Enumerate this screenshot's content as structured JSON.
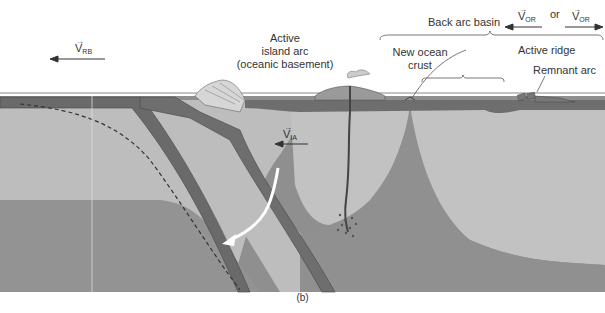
{
  "figure": {
    "caption": "(b)",
    "labels": {
      "active_island_arc_line1": "Active",
      "active_island_arc_line2": "island arc",
      "active_island_arc_line3": "(oceanic basement)",
      "back_arc_basin": "Back arc basin",
      "new_ocean_crust_line1": "New ocean",
      "new_ocean_crust_line2": "crust",
      "active_ridge": "Active ridge",
      "remnant_arc": "Remnant arc",
      "or": "or"
    },
    "vectors": {
      "v_rb": {
        "symbol": "V",
        "subscript": "RB",
        "direction": "left"
      },
      "v_ia": {
        "symbol": "V",
        "subscript": "IA",
        "direction": "left"
      },
      "v_or_left": {
        "symbol": "V",
        "subscript": "OR",
        "direction": "left"
      },
      "v_or_right": {
        "symbol": "V",
        "subscript": "OR",
        "direction": "right"
      }
    },
    "colors": {
      "background": "#ffffff",
      "sea_line": "#888888",
      "crust": "#6e6e6e",
      "lithosphere_light": "#bdbdbd",
      "asthenosphere": "#8f8f8f",
      "slab": "#5a5a5a",
      "text": "#333333"
    }
  }
}
